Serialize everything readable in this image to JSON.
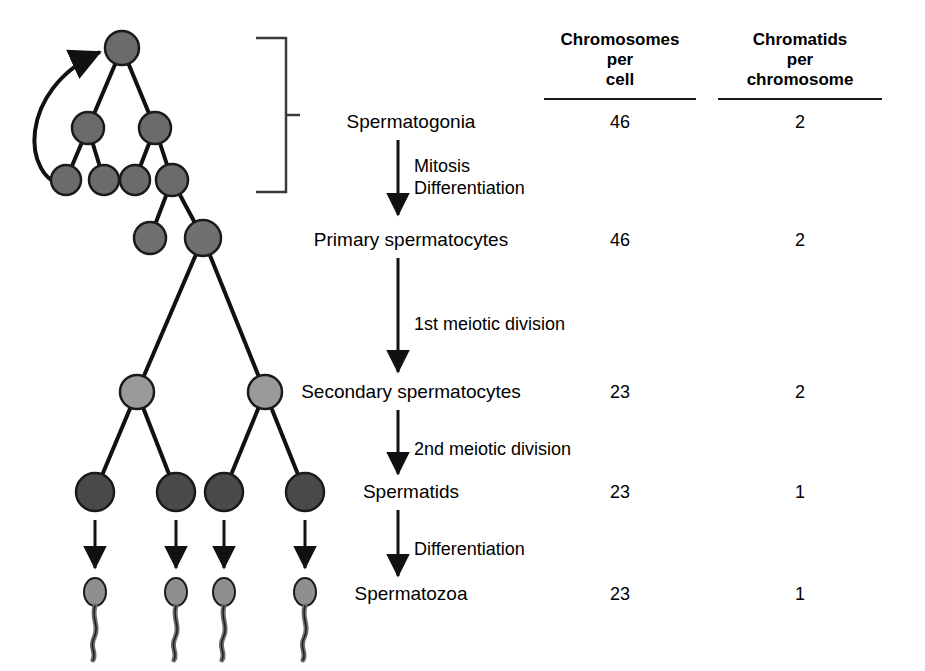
{
  "figure": {
    "columns": [
      {
        "id": "chromosomes_per_cell",
        "line1": "Chromosomes",
        "line2": "per",
        "line3": "cell",
        "cx": 620
      },
      {
        "id": "chromatids_per_chromosome",
        "line1": "Chromatids",
        "line2": "per",
        "line3": "chromosome",
        "cx": 800
      }
    ],
    "stages": [
      {
        "id": "spermatogonia",
        "label": "Spermatogonia",
        "chromosomes": "46",
        "chromatids": "2",
        "y": 122
      },
      {
        "id": "primary-spermatocytes",
        "label": "Primary spermatocytes",
        "chromosomes": "46",
        "chromatids": "2",
        "y": 240
      },
      {
        "id": "secondary-spermatocytes",
        "label": "Secondary spermatocytes",
        "chromosomes": "23",
        "chromatids": "2",
        "y": 392
      },
      {
        "id": "spermatids",
        "label": "Spermatids",
        "chromosomes": "23",
        "chromatids": "1",
        "y": 492
      },
      {
        "id": "spermatozoa",
        "label": "Spermatozoa",
        "chromosomes": "23",
        "chromatids": "1",
        "y": 594
      }
    ],
    "processes": [
      {
        "id": "mitosis-differentiation",
        "lines": [
          "Mitosis",
          "Differentiation"
        ],
        "x": 418,
        "y": 152
      },
      {
        "id": "first-meiotic-division",
        "lines": [
          "1st meiotic division"
        ],
        "x": 418,
        "y": 312
      },
      {
        "id": "second-meiotic-division",
        "lines": [
          "2nd meiotic division"
        ],
        "x": 418,
        "y": 437
      },
      {
        "id": "differentiation",
        "lines": [
          "Differentiation"
        ],
        "x": 418,
        "y": 537
      }
    ],
    "colors": {
      "spermatogonium": "#6b6b6b",
      "primary_spermatocyte": "#707070",
      "secondary_spermatocyte": "#9a9a9a",
      "spermatid": "#4a4a4a",
      "spermatozoon": "#8f8f8f",
      "outline": "#1a1a1a",
      "text": "#000000"
    }
  }
}
